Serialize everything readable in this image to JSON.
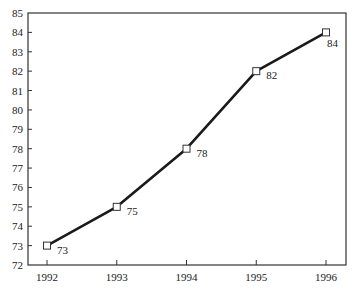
{
  "chart_data": {
    "type": "line",
    "title": "",
    "xlabel": "",
    "ylabel": "",
    "categories": [
      "1992",
      "1993",
      "1994",
      "1995",
      "1996"
    ],
    "x": [
      1992,
      1993,
      1994,
      1995,
      1996
    ],
    "series": [
      {
        "name": "",
        "values": [
          73,
          75,
          78,
          82,
          84
        ],
        "marker": "hollow-square",
        "color": "#1a1a1a"
      }
    ],
    "data_labels": [
      "73",
      "75",
      "78",
      "82",
      "84"
    ],
    "ylim": [
      72,
      85
    ],
    "yticks": [
      72,
      73,
      74,
      75,
      76,
      77,
      78,
      79,
      80,
      81,
      82,
      83,
      84,
      85
    ],
    "ytick_labels": [
      "72",
      "73",
      "74",
      "75",
      "76",
      "77",
      "78",
      "79",
      "80",
      "81",
      "82",
      "83",
      "84",
      "85"
    ],
    "xtick_labels": [
      "1992",
      "1993",
      "1994",
      "1995",
      "1996"
    ],
    "grid": false,
    "legend": null,
    "frame": "full-box"
  },
  "colors": {
    "line": "#1a1a1a",
    "axis": "#333333",
    "text": "#222222",
    "background": "#ffffff"
  }
}
